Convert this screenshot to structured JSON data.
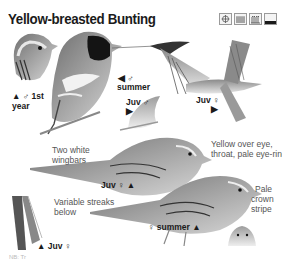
{
  "page": {
    "title": "Yellow-breasted Bunting",
    "colors": {
      "text": "#1a1a1a",
      "note_text": "#555555",
      "plumage_dark": "#222222",
      "plumage_mid": "#7a7a7a",
      "plumage_light": "#cfcfcf",
      "background": "#ffffff"
    }
  },
  "icons": [
    {
      "name": "range-compass-icon",
      "symbol": "⊕"
    },
    {
      "name": "habitat-reedbed-icon",
      "symbol": "▦"
    },
    {
      "name": "habitat-grassland-icon",
      "symbol": "ψ"
    },
    {
      "name": "habitat-ground-icon",
      "symbol": "▁"
    }
  ],
  "labels": {
    "male_1st_year_line1": "▲ ♂ 1st",
    "male_1st_year_line2": "year",
    "male_summer_arrow": "◀ ♂",
    "male_summer": "summer",
    "juv_male": "Juv ♂",
    "juv_male_arrow": "▶",
    "juv_female_flight": "Juv ♀",
    "juv_female_flight_arrow": "▶",
    "juv_female_perched": "Juv ♀ ▲",
    "female_summer": "♀ summer ▲",
    "juv_female_bottom": "▲ Juv ♀"
  },
  "notes": {
    "wingbars_line1": "Two white",
    "wingbars_line2": "wingbars",
    "eye_line1": "Yellow over eye,",
    "eye_line2": "throat, pale eye-ring",
    "streaks_line1": "Variable streaks",
    "streaks_line2": "below",
    "crown_line1": "Pale",
    "crown_line2": "crown",
    "crown_line3": "stripe"
  },
  "footer": {
    "text": "NB: Tr"
  }
}
